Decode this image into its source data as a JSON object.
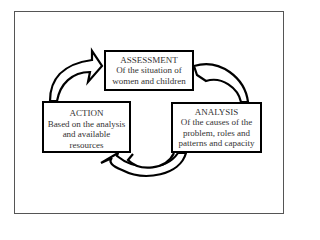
{
  "diagram": {
    "type": "cycle",
    "colors": {
      "border": "#000000",
      "frame": "#555555",
      "text": "#333333",
      "background": "#ffffff"
    },
    "nodes": [
      {
        "id": "assessment",
        "title": "ASSESSMENT",
        "lines": [
          "Of the situation of",
          "women and children"
        ]
      },
      {
        "id": "analysis",
        "title": "ANALYSIS",
        "lines": [
          "Of the causes of the",
          "problem, roles and",
          "patterns and capacity"
        ]
      },
      {
        "id": "action",
        "title": "ACTION",
        "lines": [
          "Based on the analysis",
          "and available",
          "resources"
        ]
      }
    ],
    "edges": [
      {
        "from": "assessment",
        "to": "analysis",
        "icon": "curved-arrow-icon"
      },
      {
        "from": "analysis",
        "to": "action",
        "icon": "curved-arrow-icon"
      },
      {
        "from": "action",
        "to": "assessment",
        "icon": "curved-arrow-icon"
      }
    ]
  }
}
